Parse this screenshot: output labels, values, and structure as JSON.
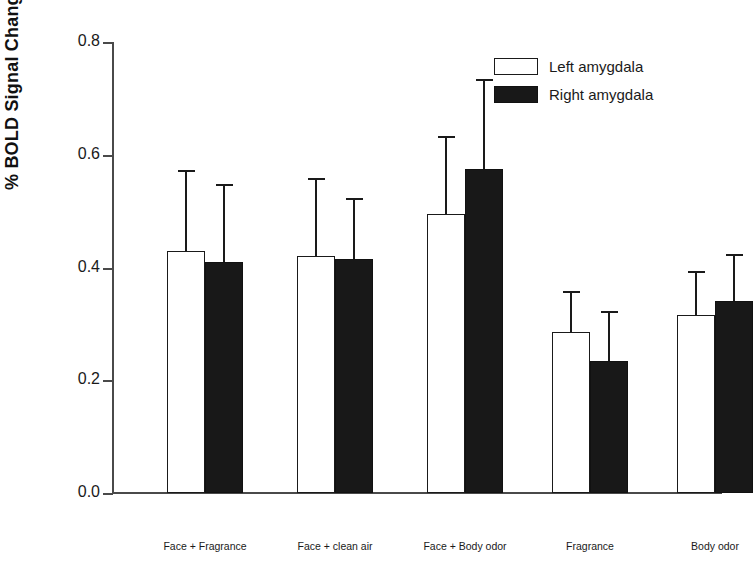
{
  "chart_data": {
    "type": "bar",
    "title": "",
    "xlabel": "",
    "ylabel": "% BOLD Signal Change",
    "ylim": [
      0.0,
      0.8
    ],
    "yticks": [
      "0.0",
      "0.2",
      "0.4",
      "0.6",
      "0.8"
    ],
    "ytick_values": [
      0.0,
      0.2,
      0.4,
      0.6,
      0.8
    ],
    "grid": false,
    "legend_position": "top-right",
    "categories": [
      "Face + Fragrance",
      "Face + clean air",
      "Face + Body odor",
      "Fragrance",
      "Body odor"
    ],
    "series": [
      {
        "name": "Left amygdala",
        "fill": "#ffffff",
        "values": [
          0.43,
          0.42,
          0.495,
          0.285,
          0.315
        ],
        "error_upper": [
          0.57,
          0.555,
          0.63,
          0.355,
          0.39
        ]
      },
      {
        "name": "Right amygdala",
        "fill": "#181818",
        "values": [
          0.41,
          0.415,
          0.575,
          0.235,
          0.34
        ],
        "error_upper": [
          0.545,
          0.52,
          0.73,
          0.32,
          0.42
        ]
      }
    ]
  },
  "legend": {
    "entries": [
      {
        "label": "Left amygdala",
        "swatch": "white"
      },
      {
        "label": "Right amygdala",
        "swatch": "black"
      }
    ]
  },
  "colors": {
    "axis": "#4a4a4a",
    "text": "#1a1a1a",
    "bar_left": "#ffffff",
    "bar_right": "#181818",
    "background": "#ffffff"
  }
}
